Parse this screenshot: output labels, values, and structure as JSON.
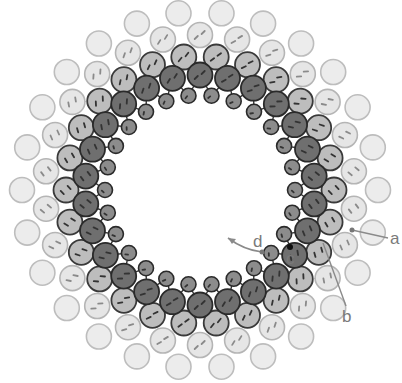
{
  "figure": {
    "center": [
      200,
      190
    ],
    "colors": {
      "background": "#ffffff",
      "bond": "#333333",
      "dash_dark": "#333333",
      "dash_light": "#8a8a8a",
      "label": "#7a7a7a",
      "pointer": "#8a8a8a"
    },
    "rings": [
      {
        "name": "outer-plain-ring",
        "radius": 178,
        "count": 26,
        "offset": 0.5,
        "r": 12.5,
        "fill": "#ececec",
        "stroke": "#bdbdbd",
        "stroke_width": 1.6,
        "dashes": false
      },
      {
        "name": "light-dashed-ring",
        "radius": 155,
        "count": 26,
        "offset": 0.0,
        "r": 12.5,
        "fill": "#e6e6e6",
        "stroke": "#b5b5b5",
        "stroke_width": 1.6,
        "dashes": true
      },
      {
        "name": "medium-gray-ring",
        "radius": 134,
        "count": 26,
        "offset": 0.5,
        "r": 12.5,
        "fill": "#bdbdbd",
        "stroke": "#3a3a3a",
        "stroke_width": 1.8,
        "dashes": true
      },
      {
        "name": "dark-ring",
        "radius": 115,
        "count": 26,
        "offset": 0.0,
        "r": 12.5,
        "fill": "#6f6f6f",
        "stroke": "#2a2a2a",
        "stroke_width": 1.8,
        "dashes": true
      },
      {
        "name": "inner-small-ring",
        "radius": 95,
        "count": 26,
        "offset": 0.5,
        "r": 7.5,
        "fill": "#8c8c8c",
        "stroke": "#2a2a2a",
        "stroke_width": 1.6,
        "dashes": true
      }
    ],
    "labels": [
      {
        "id": "a",
        "text": "a",
        "x": 390,
        "y": 244
      },
      {
        "id": "b",
        "text": "b",
        "x": 342,
        "y": 322
      },
      {
        "id": "c",
        "text": "c",
        "x": 286,
        "y": 264
      },
      {
        "id": "d",
        "text": "d",
        "x": 253,
        "y": 247
      }
    ],
    "pointers": [
      {
        "id": "a-leader",
        "from": [
          388,
          238
        ],
        "to": [
          352,
          230
        ]
      },
      {
        "id": "b-leader",
        "from": [
          346,
          306
        ],
        "to": [
          323,
          243
        ]
      }
    ],
    "arrow_d": {
      "path": "M262 252 Q244 250 228 238",
      "start_dot": [
        262,
        252
      ],
      "head": [
        228,
        238
      ]
    },
    "dot_c": [
      290,
      247
    ]
  }
}
